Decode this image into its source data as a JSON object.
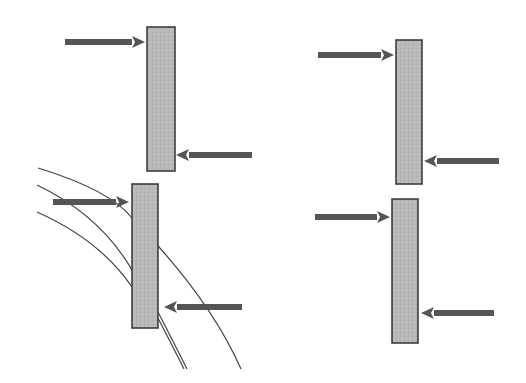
{
  "colors": {
    "background": "#ffffff",
    "bar_fill": "#b9b9b9",
    "bar_stroke": "#333333",
    "arrow": "#555555",
    "curve": "#444444"
  },
  "panels": [
    {
      "id": "top-left",
      "bar": {
        "x": 147,
        "y": 27,
        "w": 28,
        "h": 144
      },
      "arrows": [
        {
          "dir": "right",
          "x1": 65,
          "x2": 145,
          "y": 42
        },
        {
          "dir": "left",
          "x1": 252,
          "x2": 176,
          "y": 155
        }
      ]
    },
    {
      "id": "top-right",
      "bar": {
        "x": 396,
        "y": 40,
        "w": 26,
        "h": 144
      },
      "arrows": [
        {
          "dir": "right",
          "x1": 318,
          "x2": 394,
          "y": 55
        },
        {
          "dir": "left",
          "x1": 499,
          "x2": 424,
          "y": 161
        }
      ]
    },
    {
      "id": "bottom-left",
      "bar": {
        "x": 132,
        "y": 184,
        "w": 26,
        "h": 144
      },
      "arrows": [
        {
          "dir": "right",
          "x1": 53,
          "x2": 129,
          "y": 202
        },
        {
          "dir": "left",
          "x1": 242,
          "x2": 164,
          "y": 307
        }
      ],
      "curves": [
        {
          "d": "M 38 168 Q 110 190 132 218 L 159 247 Q 215 310 241 369"
        },
        {
          "d": "M 37 185 Q 100 215 132 270 L 159 314 Q 175 345 187 369"
        },
        {
          "d": "M 37 212 Q 100 240 132 287 L 159 320 Q 172 345 184 369"
        }
      ]
    },
    {
      "id": "bottom-right",
      "bar": {
        "x": 392,
        "y": 199,
        "w": 26,
        "h": 144
      },
      "arrows": [
        {
          "dir": "right",
          "x1": 315,
          "x2": 390,
          "y": 217
        },
        {
          "dir": "left",
          "x1": 494,
          "x2": 421,
          "y": 313
        }
      ]
    }
  ]
}
